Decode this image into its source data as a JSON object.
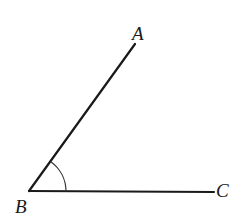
{
  "diagram": {
    "type": "angle",
    "colors": {
      "stroke": "#1a1a1a",
      "background": "#ffffff"
    },
    "points": {
      "A": {
        "label": "A",
        "x": 135,
        "y": 44
      },
      "B": {
        "label": "B",
        "x": 29,
        "y": 191
      },
      "C": {
        "label": "C",
        "x": 214,
        "y": 192
      }
    },
    "segments": [
      {
        "from": "B",
        "to": "A"
      },
      {
        "from": "B",
        "to": "C"
      }
    ],
    "angle_mark": {
      "vertex": "B",
      "between": [
        "A",
        "C"
      ],
      "radius": 37
    }
  }
}
